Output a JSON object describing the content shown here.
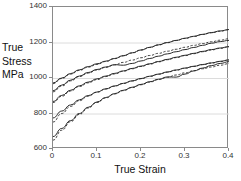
{
  "chart_data": {
    "type": "line",
    "title": "",
    "xlabel": "True Strain",
    "ylabel": "True Stress MPa",
    "ylabel_lines": [
      "True",
      "Stress",
      "MPa"
    ],
    "xlim": [
      0,
      0.4
    ],
    "ylim": [
      600,
      1400
    ],
    "xticks": [
      0,
      0.1,
      0.2,
      0.3,
      0.4
    ],
    "xticklabels": [
      "0",
      "0.1",
      "0.2",
      "0.3",
      "0.4"
    ],
    "yticks": [
      600,
      800,
      1000,
      1200,
      1400
    ],
    "yticklabels": [
      "600",
      "800",
      "1000",
      "1200",
      "1400"
    ],
    "grid": "horizontal",
    "legend": "none",
    "x": [
      0.0,
      0.02,
      0.04,
      0.06,
      0.08,
      0.1,
      0.12,
      0.14,
      0.16,
      0.18,
      0.2,
      0.22,
      0.24,
      0.26,
      0.28,
      0.3,
      0.32,
      0.34,
      0.36,
      0.38,
      0.4
    ],
    "series": [
      {
        "name": "Curve 1 experimental",
        "style": "solid",
        "values": [
          972,
          1000,
          1025,
          1046,
          1064,
          1080,
          1095,
          1110,
          1126,
          1142,
          1158,
          1173,
          1187,
          1200,
          1212,
          1224,
          1235,
          1246,
          1256,
          1265,
          1273
        ]
      },
      {
        "name": "Curve 1 model",
        "style": "dashed",
        "values": [
          968,
          997,
          1022,
          1043,
          1061,
          1077,
          1093,
          1109,
          1125,
          1141,
          1157,
          1172,
          1186,
          1199,
          1211,
          1223,
          1234,
          1245,
          1255,
          1264,
          1272
        ]
      },
      {
        "name": "Curve 2 experimental",
        "style": "solid",
        "values": [
          928,
          960,
          988,
          1011,
          1031,
          1048,
          1062,
          1075,
          1072,
          1082,
          1096,
          1110,
          1123,
          1136,
          1148,
          1160,
          1172,
          1184,
          1196,
          1205,
          1212
        ]
      },
      {
        "name": "Curve 2 model",
        "style": "dashed",
        "values": [
          922,
          955,
          984,
          1008,
          1028,
          1045,
          1060,
          1074,
          1088,
          1101,
          1114,
          1127,
          1139,
          1151,
          1162,
          1173,
          1184,
          1194,
          1204,
          1213,
          1221
        ]
      },
      {
        "name": "Curve 3 experimental",
        "style": "solid",
        "values": [
          868,
          902,
          931,
          956,
          977,
          995,
          1011,
          1026,
          1040,
          1054,
          1067,
          1080,
          1093,
          1105,
          1117,
          1128,
          1139,
          1150,
          1160,
          1169,
          1177
        ]
      },
      {
        "name": "Curve 3 model",
        "style": "dashed",
        "values": [
          862,
          897,
          927,
          952,
          973,
          991,
          1008,
          1023,
          1038,
          1052,
          1065,
          1078,
          1091,
          1103,
          1115,
          1126,
          1137,
          1148,
          1158,
          1167,
          1175
        ]
      },
      {
        "name": "Curve 4 experimental",
        "style": "solid",
        "values": [
          775,
          814,
          848,
          877,
          901,
          921,
          939,
          955,
          970,
          984,
          997,
          1010,
          1022,
          1034,
          1045,
          1056,
          1066,
          1076,
          1085,
          1094,
          1102
        ]
      },
      {
        "name": "Curve 4 model",
        "style": "dashed",
        "values": [
          752,
          800,
          840,
          872,
          898,
          920,
          938,
          954,
          969,
          983,
          996,
          1009,
          1021,
          1033,
          1044,
          1055,
          1065,
          1075,
          1084,
          1093,
          1101
        ]
      },
      {
        "name": "Curve 5 experimental",
        "style": "solid",
        "values": [
          670,
          716,
          760,
          800,
          835,
          865,
          890,
          912,
          931,
          948,
          964,
          979,
          993,
          1006,
          1005,
          1022,
          1040,
          1056,
          1070,
          1082,
          1092
        ]
      },
      {
        "name": "Curve 5 model",
        "style": "dashed",
        "values": [
          650,
          706,
          754,
          795,
          831,
          862,
          888,
          910,
          929,
          946,
          962,
          977,
          991,
          1004,
          1017,
          1029,
          1041,
          1052,
          1062,
          1072,
          1081
        ]
      }
    ],
    "annotations": []
  }
}
